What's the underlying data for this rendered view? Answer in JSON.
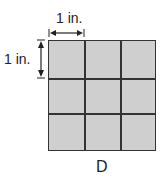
{
  "figure": {
    "width_label": "1 in.",
    "height_label": "1 in.",
    "caption": "D",
    "grid": {
      "rows": 3,
      "cols": 3,
      "fill": "#cfcfcf",
      "line": "#333333"
    }
  }
}
